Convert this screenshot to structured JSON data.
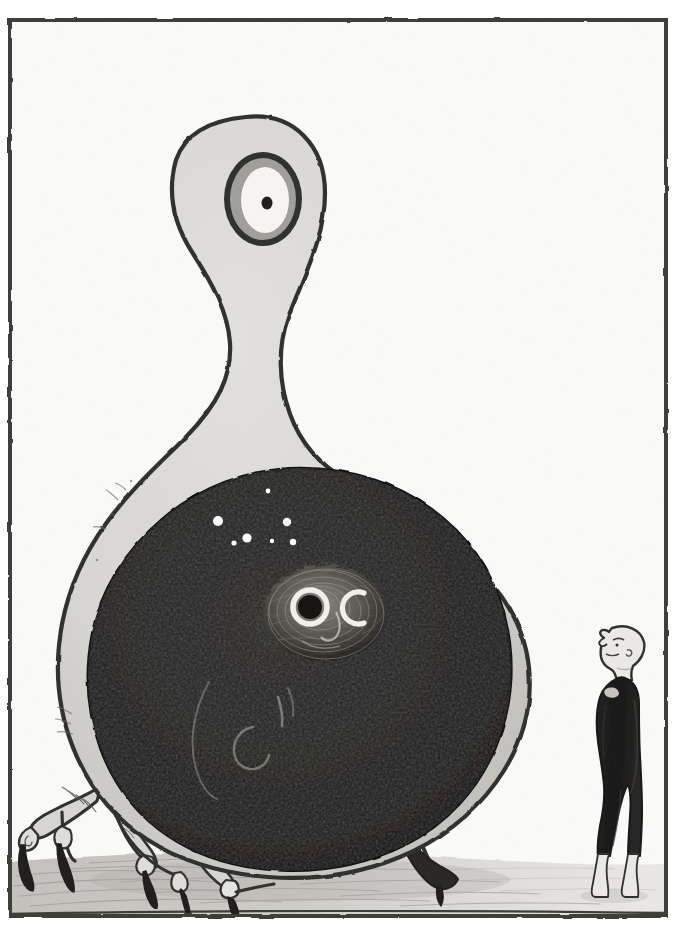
{
  "artwork": {
    "title": "Cyclops Void-Belly Creature and Standing Man",
    "medium": "pen-and-ink illustration",
    "width": 683,
    "height": 939,
    "background_color": "#fbfbfa",
    "frame": {
      "name": "ink-border-frame",
      "color": "#3a3a38",
      "x": 8,
      "y": 18,
      "width": 660,
      "height": 900,
      "stroke_width": 4
    },
    "palette": {
      "paper": "#fbfbfa",
      "body_fill": "#d9d7d3",
      "body_shadow": "#c3c1bd",
      "ink_outline": "#2e2e2c",
      "void_black": "#191817",
      "void_black_deep": "#0d0c0c",
      "eye_iris_gray": "#9a9893",
      "eye_white": "#f6f5f2",
      "ground_wash": "#cfcdc8",
      "ground_wash_light": "#e4e2de",
      "figure_suit": "#1a1918",
      "skin_light": "#e8e6e2",
      "star_white": "#ffffff",
      "owl_fur": "#6e6b65"
    }
  },
  "subjects": [
    {
      "id": "creature",
      "name": "cyclops-void-creature",
      "label": "Giant pear-shaped cyclops creature",
      "description": "A towering light-gray creature with a long tapering neck, a single large eye on its bulbous head, and an enormous teardrop body containing a black void. It stands on four thin clawed bird legs.",
      "parts": [
        {
          "name": "head",
          "label": "Bulbous head"
        },
        {
          "name": "single-eye",
          "label": "Single large eye"
        },
        {
          "name": "neck",
          "label": "Long tapering neck"
        },
        {
          "name": "body",
          "label": "Teardrop body"
        },
        {
          "name": "void-belly",
          "label": "Black void belly"
        },
        {
          "name": "legs",
          "label": "Four thin clawed legs"
        }
      ]
    },
    {
      "id": "void-contents",
      "name": "void-belly-contents",
      "label": "Contents of the void belly",
      "items": [
        {
          "name": "owl-face",
          "label": "Owl face with one ring eye and one crescent eye"
        },
        {
          "name": "star-field",
          "label": "Scattered white stars"
        },
        {
          "name": "ghost-arcs",
          "label": "Faint luminous arcs and crescents"
        }
      ]
    },
    {
      "id": "man",
      "name": "standing-man-figure",
      "label": "Bald man in a dark bodysuit",
      "description": "A slender bald man in a black bodysuit with pale feet stands at the right, head tilted back, gazing up at the creature.",
      "parts": [
        {
          "name": "head",
          "label": "Bald head in left profile"
        },
        {
          "name": "bodysuit",
          "label": "Dark fitted bodysuit"
        },
        {
          "name": "feet",
          "label": "Pale pointed feet"
        }
      ]
    },
    {
      "id": "ground",
      "name": "ground-plane",
      "label": "Hatched ground plane",
      "description": "A low horizon of hatched gray wash running across the bottom of the frame."
    }
  ],
  "star_field": [
    {
      "cx": 268,
      "cy": 491,
      "r": 2.4
    },
    {
      "cx": 218,
      "cy": 521,
      "r": 5.0
    },
    {
      "cx": 287,
      "cy": 522,
      "r": 4.2
    },
    {
      "cx": 247,
      "cy": 538,
      "r": 4.6
    },
    {
      "cx": 234,
      "cy": 543,
      "r": 2.6
    },
    {
      "cx": 272,
      "cy": 541,
      "r": 2.2
    },
    {
      "cx": 293,
      "cy": 542,
      "r": 3.2
    }
  ],
  "creature_legs": [
    {
      "name": "leg-front-left",
      "label": "Front-left clawed leg"
    },
    {
      "name": "leg-mid-left",
      "label": "Mid-left clawed leg"
    },
    {
      "name": "leg-center",
      "label": "Center clawed leg"
    },
    {
      "name": "leg-right",
      "label": "Right clawed leg"
    }
  ]
}
